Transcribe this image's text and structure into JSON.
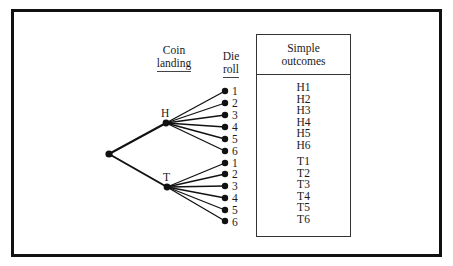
{
  "headers": {
    "coin": [
      "Coin",
      "landing"
    ],
    "die": [
      "Die",
      "roll"
    ],
    "outcomes": [
      "Simple",
      "outcomes"
    ]
  },
  "branches": {
    "heads_label": "H",
    "tails_label": "T",
    "die_faces": [
      "1",
      "2",
      "3",
      "4",
      "5",
      "6"
    ]
  },
  "outcomes": {
    "heads": [
      "H1",
      "H2",
      "H3",
      "H4",
      "H5",
      "H6"
    ],
    "tails": [
      "T1",
      "T2",
      "T3",
      "T4",
      "T5",
      "T6"
    ]
  },
  "colors": {
    "ink": "#111111",
    "background": "#ffffff"
  }
}
